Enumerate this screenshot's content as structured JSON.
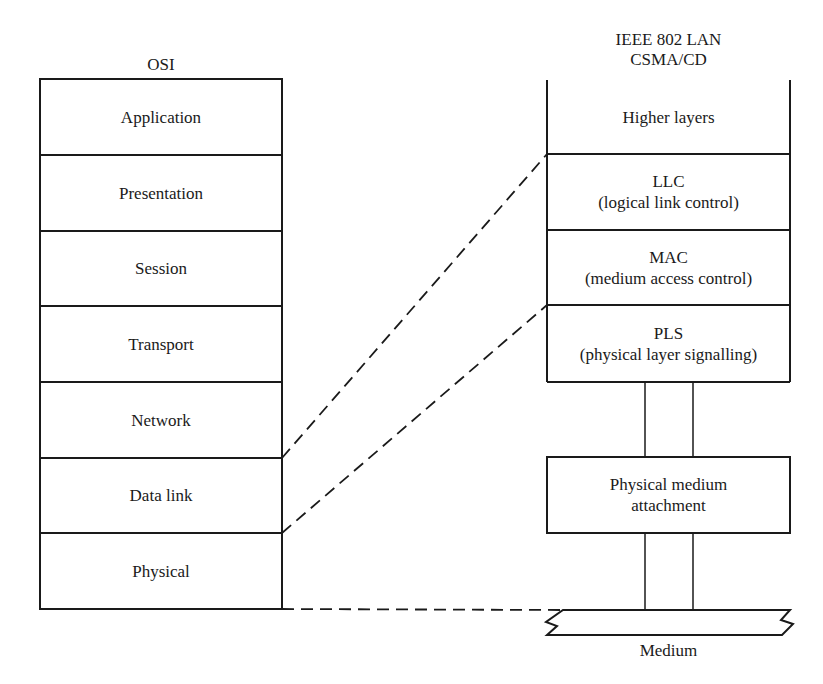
{
  "osi": {
    "title": "OSI",
    "layers": [
      "Application",
      "Presentation",
      "Session",
      "Transport",
      "Network",
      "Data link",
      "Physical"
    ]
  },
  "ieee": {
    "title_line1": "IEEE 802 LAN",
    "title_line2": "CSMA/CD",
    "higher": "Higher layers",
    "llc": {
      "name": "LLC",
      "desc": "(logical link control)"
    },
    "mac": {
      "name": "MAC",
      "desc": "(medium access control)"
    },
    "pls": {
      "name": "PLS",
      "desc": "(physical layer signalling)"
    },
    "pma": {
      "line1": "Physical medium",
      "line2": "attachment"
    },
    "medium": "Medium"
  }
}
